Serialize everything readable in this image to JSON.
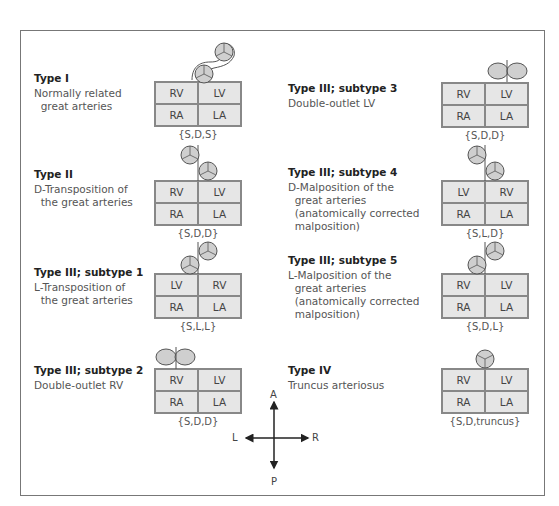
{
  "figure": {
    "types": [
      {
        "id": "type1",
        "title": "Type I",
        "desc": "Normally related\n  great arteries",
        "grid": [
          "RV",
          "LV",
          "RA",
          "LA"
        ],
        "code": "{S,D,S}"
      },
      {
        "id": "type2",
        "title": "Type II",
        "desc": "D-Transposition of\n  the great arteries",
        "grid": [
          "RV",
          "LV",
          "RA",
          "LA"
        ],
        "code": "{S,D,D}"
      },
      {
        "id": "type3-1",
        "title": "Type III; subtype 1",
        "desc": "L-Transposition of\n  the great arteries",
        "grid": [
          "LV",
          "RV",
          "RA",
          "LA"
        ],
        "code": "{S,L,L}"
      },
      {
        "id": "type3-2",
        "title": "Type III; subtype 2",
        "desc": "Double-outlet RV",
        "grid": [
          "RV",
          "LV",
          "RA",
          "LA"
        ],
        "code": "{S,D,D}"
      },
      {
        "id": "type3-3",
        "title": "Type III; subtype 3",
        "desc": "Double-outlet LV",
        "grid": [
          "RV",
          "LV",
          "RA",
          "LA"
        ],
        "code": "{S,D,D}"
      },
      {
        "id": "type3-4",
        "title": "Type III; subtype 4",
        "desc": "D-Malposition of the\n  great arteries\n  (anatomically corrected\n  malposition)",
        "grid": [
          "LV",
          "RV",
          "RA",
          "LA"
        ],
        "code": "{S,L,D}"
      },
      {
        "id": "type3-5",
        "title": "Type III; subtype 5",
        "desc": "L-Malposition of the\n  great arteries\n  (anatomically corrected\n  malposition)",
        "grid": [
          "RV",
          "LV",
          "RA",
          "LA"
        ],
        "code": "{S,D,L}"
      },
      {
        "id": "type4",
        "title": "Type IV",
        "desc": "Truncus arteriosus",
        "grid": [
          "RV",
          "LV",
          "RA",
          "LA"
        ],
        "code": "{S,D,truncus}"
      }
    ],
    "compass": {
      "up": "A",
      "down": "P",
      "left": "L",
      "right": "R"
    },
    "colors": {
      "cell_fill": "#e6e6e6",
      "vessel_fill": "#cfcfcf",
      "border": "#888888"
    }
  }
}
